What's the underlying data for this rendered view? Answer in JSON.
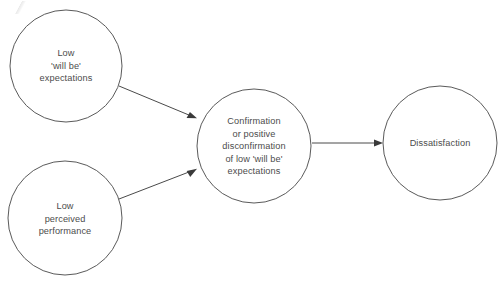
{
  "diagram": {
    "background_color": "#ffffff",
    "stroke_color": "#5a5a5a",
    "text_color": "#4c4c4c",
    "nodes": [
      {
        "id": "low-will-be-expectations",
        "label": "Low\n'will be'\nexpectations",
        "shape": "circle",
        "cx": 66,
        "cy": 66,
        "r": 56
      },
      {
        "id": "low-perceived-performance",
        "label": "Low\nperceived\nperformance",
        "shape": "circle",
        "cx": 65,
        "cy": 218,
        "r": 57
      },
      {
        "id": "confirmation-or-positive-disconfirmation",
        "label": "Confirmation\nor positive\ndisconfirmation\nof low 'will be'\nexpectations",
        "shape": "circle",
        "cx": 254,
        "cy": 146,
        "r": 57
      },
      {
        "id": "dissatisfaction",
        "label": "Dissatisfaction",
        "shape": "circle",
        "cx": 440,
        "cy": 143,
        "r": 57
      }
    ],
    "edges": [
      {
        "id": "expectations-to-confirmation",
        "from": "low-will-be-expectations",
        "to": "confirmation-or-positive-disconfirmation",
        "x1": 119,
        "y1": 86,
        "x2": 197,
        "y2": 118
      },
      {
        "id": "performance-to-confirmation",
        "from": "low-perceived-performance",
        "to": "confirmation-or-positive-disconfirmation",
        "x1": 119,
        "y1": 199,
        "x2": 197,
        "y2": 169
      },
      {
        "id": "confirmation-to-dissatisfaction",
        "from": "confirmation-or-positive-disconfirmation",
        "to": "dissatisfaction",
        "x1": 312,
        "y1": 143,
        "x2": 383,
        "y2": 143
      }
    ]
  }
}
